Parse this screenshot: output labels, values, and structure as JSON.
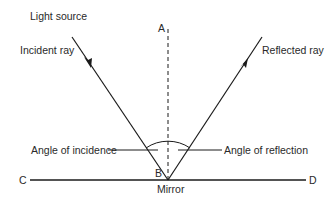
{
  "diagram": {
    "labels": {
      "light_source": "Light source",
      "incident_ray": "Incident ray",
      "reflected_ray": "Reflected ray",
      "point_a": "A",
      "point_b": "B",
      "point_c": "C",
      "point_d": "D",
      "mirror": "Mirror",
      "angle_incidence": "Angle of incidence",
      "angle_reflection": "Angle of reflection"
    },
    "colors": {
      "line": "#1a1a1a",
      "text": "#2a2a2a",
      "background": "#ffffff"
    }
  }
}
